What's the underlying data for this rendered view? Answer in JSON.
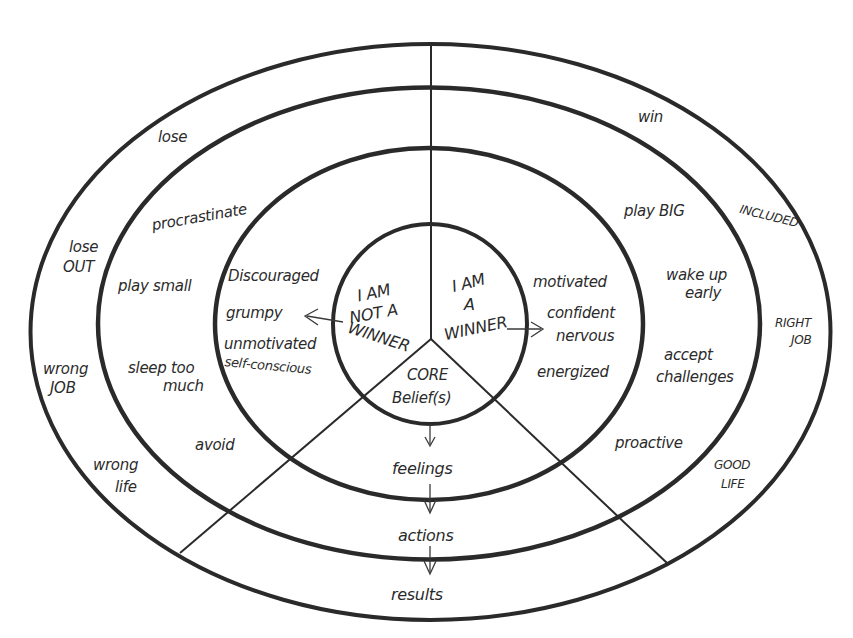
{
  "diagram": {
    "type": "concentric-belief-model",
    "center": {
      "left_segment": [
        "I AM",
        "NOT A",
        "WINNER"
      ],
      "right_segment": [
        "I AM",
        "A",
        "WINNER"
      ],
      "bottom_segment": [
        "CORE",
        "Belief(s)"
      ]
    },
    "flow": {
      "feelings": "feelings",
      "actions": "actions",
      "results": "results"
    },
    "negative_side": {
      "feelings": [
        "Discouraged",
        "grumpy",
        "unmotivated",
        "self-conscious"
      ],
      "actions": {
        "procrastinate": "procrastinate",
        "play_small": "play small",
        "sleep_too_much": [
          "sleep too",
          "much"
        ],
        "avoid": "avoid"
      },
      "results": {
        "lose": "lose",
        "lose_out": [
          "lose",
          "OUT"
        ],
        "wrong_job": [
          "wrong",
          "JOB"
        ],
        "wrong_life": [
          "wrong",
          "life"
        ]
      }
    },
    "positive_side": {
      "feelings": [
        "motivated",
        "confident",
        "nervous",
        "energized"
      ],
      "actions": {
        "play_big": "play BIG",
        "wake_up_early": [
          "wake up",
          "early"
        ],
        "accept_challenges": [
          "accept",
          "challenges"
        ],
        "proactive": "proactive"
      },
      "results": {
        "win": "win",
        "included": "INCLUDED",
        "right_job": [
          "RIGHT",
          "JOB"
        ],
        "good_life": [
          "GOOD",
          "LIFE"
        ]
      }
    },
    "colors": {
      "ink": "#2a2a2a",
      "background": "#ffffff"
    }
  }
}
